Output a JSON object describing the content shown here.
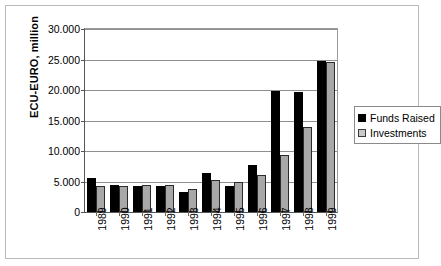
{
  "chart_data": {
    "type": "bar",
    "title": "",
    "xlabel": "",
    "ylabel": "ECU-EURO, million",
    "ylim": [
      0,
      30000
    ],
    "ytick_step": 5000,
    "grid": true,
    "legend_position": "right",
    "categories": [
      "1989",
      "1990",
      "1991",
      "1992",
      "1993",
      "1994",
      "1995",
      "1996",
      "1997",
      "1998",
      "1999"
    ],
    "ytick_labels": [
      "0",
      "5.000",
      "10.000",
      "15.000",
      "20.000",
      "25.000",
      "30.000"
    ],
    "ytick_values": [
      0,
      5000,
      10000,
      15000,
      20000,
      25000,
      30000
    ],
    "series": [
      {
        "name": "Funds Raised",
        "color": "#000000",
        "values": [
          5500,
          4500,
          4200,
          4200,
          3200,
          6400,
          4200,
          7700,
          19900,
          19700,
          24700
        ]
      },
      {
        "name": "Investments",
        "color": "#a8a8a8",
        "values": [
          4300,
          4200,
          4500,
          4500,
          3800,
          5200,
          5000,
          6000,
          9400,
          13900,
          24600
        ]
      }
    ]
  },
  "legend": {
    "items": [
      {
        "label": "Funds Raised",
        "swatch": "raised"
      },
      {
        "label": "Investments",
        "swatch": "inv"
      }
    ]
  }
}
